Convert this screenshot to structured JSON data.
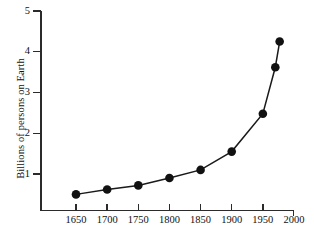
{
  "chart_data": {
    "type": "line",
    "title": "",
    "subtitle": "",
    "xlabel": "",
    "ylabel": "Billions of persons on Earth",
    "xlim": [
      1625,
      2000
    ],
    "ylim": [
      0,
      5
    ],
    "grid": false,
    "legend": null,
    "x_ticks": [
      1650,
      1700,
      1750,
      1800,
      1850,
      1900,
      1950,
      2000
    ],
    "x_tick_labels": [
      "1650",
      "1700",
      "1750",
      "1800",
      "1850",
      "1900",
      "1950",
      "2000"
    ],
    "y_ticks": [
      1,
      2,
      3,
      4,
      5
    ],
    "y_tick_labels": [
      "1",
      "2",
      "3",
      "4",
      "5"
    ],
    "marker": "filled-circle",
    "series": [
      {
        "name": "World population",
        "x": [
          1650,
          1700,
          1750,
          1800,
          1850,
          1900,
          1950,
          1970,
          1977
        ],
        "values": [
          0.5,
          0.62,
          0.72,
          0.9,
          1.1,
          1.55,
          2.48,
          3.62,
          4.25
        ]
      }
    ]
  },
  "axis_title": {
    "y": "Billions of persons on Earth"
  }
}
